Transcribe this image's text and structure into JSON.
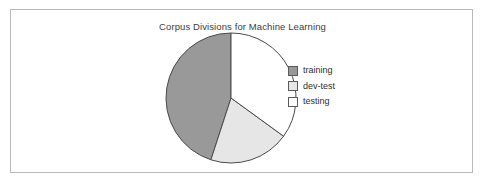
{
  "figure": {
    "title": "Corpus Divisions for Machine Learning",
    "frame_color": "#b9b9b9",
    "background": "#ffffff"
  },
  "legend": {
    "position": "right",
    "items": [
      {
        "label": "training",
        "color": "#999999",
        "swatch_name": "legend-swatch-training"
      },
      {
        "label": "dev-test",
        "color": "#e6e6e6",
        "swatch_name": "legend-swatch-dev-test"
      },
      {
        "label": "testing",
        "color": "#ffffff",
        "swatch_name": "legend-swatch-testing"
      }
    ]
  },
  "chart_data": {
    "type": "pie",
    "title": "Corpus Divisions for Machine Learning",
    "xlabel": "",
    "ylabel": "",
    "categories": [
      "training",
      "dev-test",
      "testing"
    ],
    "values": [
      45,
      20,
      35
    ],
    "units": "percent",
    "colors": [
      "#999999",
      "#e6e6e6",
      "#ffffff"
    ],
    "edge_color": "#4a4a4a",
    "start_angle_deg": 90,
    "direction": "counterclockwise",
    "legend_entries": [
      "training",
      "dev-test",
      "testing"
    ],
    "grid": false,
    "legend_position": "right",
    "center": {
      "x": 220,
      "y": 103
    },
    "radius": 65,
    "slices": [
      {
        "name": "training",
        "value": 45,
        "color": "#999999",
        "start_deg": 90,
        "end_deg": 252
      },
      {
        "name": "dev-test",
        "value": 20,
        "color": "#e6e6e6",
        "start_deg": 252,
        "end_deg": 324
      },
      {
        "name": "testing",
        "value": 35,
        "color": "#ffffff",
        "start_deg": 324,
        "end_deg": 450
      }
    ]
  }
}
